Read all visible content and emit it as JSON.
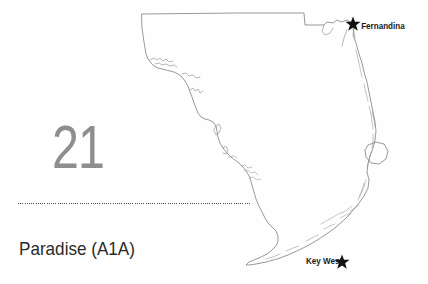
{
  "page": {
    "chapter_number": "21",
    "chapter_title": "Paradise (A1A)",
    "background_color": "#ffffff",
    "number_color": "#8e8e8e",
    "title_color": "#2b2b2b",
    "rule_color": "#4a4a4a"
  },
  "map": {
    "name": "florida-outline-map",
    "outline_color": "#6d6d6d",
    "marker_color": "#111111",
    "cities": [
      {
        "name": "Fernandina",
        "label": "Fernandina",
        "marker": "star",
        "label_side": "right",
        "x": 353,
        "y": 24
      },
      {
        "name": "Key West",
        "label": "Key West",
        "marker": "star",
        "label_side": "left",
        "x": 342,
        "y": 262
      }
    ],
    "features": [
      "state-coastline",
      "lake-okeechobee",
      "barrier-islands",
      "florida-keys"
    ]
  }
}
